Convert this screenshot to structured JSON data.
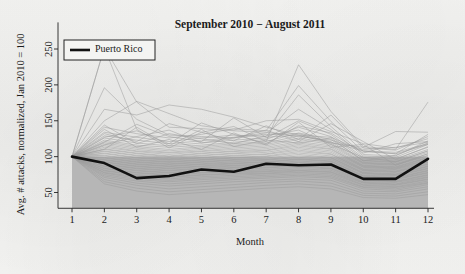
{
  "chart_data": {
    "type": "line",
    "title": "September 2010 − August 2011",
    "xlabel": "Month",
    "ylabel": "Avg. # attacks, normalized, Jan 2010 = 100",
    "xlim": [
      1,
      12
    ],
    "ylim": [
      28,
      262
    ],
    "xticks": [
      1,
      2,
      3,
      4,
      5,
      6,
      7,
      8,
      9,
      10,
      11,
      12
    ],
    "xticklabels": [
      "1",
      "2",
      "3",
      "4",
      "5",
      "6",
      "7",
      "8",
      "9",
      "10",
      "11",
      "12"
    ],
    "yticks": [
      50,
      100,
      150,
      200,
      250
    ],
    "yticklabels": [
      "50",
      "100",
      "150",
      "200",
      "250"
    ],
    "grid": false,
    "legend": {
      "position": "top-left",
      "entries": [
        {
          "name": "Puerto Rico",
          "color": "#111111",
          "linewidth": 2.6
        }
      ]
    },
    "shaded_band": {
      "description": "gray band below the normalization level",
      "from_value": 100,
      "to_value": 28,
      "color": "#b3b3b3"
    },
    "background_series_style": {
      "color": "#9a9a9a",
      "linewidth": 0.6,
      "opacity": 0.85,
      "label": "other jurisdictions"
    },
    "categories": [
      1,
      2,
      3,
      4,
      5,
      6,
      7,
      8,
      9,
      10,
      11,
      12
    ],
    "series": [
      {
        "name": "Puerto Rico",
        "highlight": true,
        "color": "#111111",
        "values": [
          100,
          91,
          70,
          73,
          82,
          79,
          90,
          88,
          89,
          69,
          69,
          97
        ]
      },
      {
        "name": "bg01",
        "values": [
          100,
          252,
          176,
          141,
          139,
          136,
          134,
          128,
          123,
          110,
          113,
          120
        ]
      },
      {
        "name": "bg02",
        "values": [
          100,
          196,
          152,
          130,
          128,
          126,
          131,
          132,
          120,
          108,
          106,
          118
        ]
      },
      {
        "name": "bg03",
        "values": [
          100,
          166,
          158,
          172,
          166,
          155,
          141,
          130,
          119,
          113,
          135,
          134
        ]
      },
      {
        "name": "bg04",
        "values": [
          100,
          150,
          177,
          160,
          143,
          137,
          150,
          152,
          135,
          118,
          112,
          125
        ]
      },
      {
        "name": "bg05",
        "values": [
          100,
          252,
          138,
          112,
          134,
          142,
          121,
          228,
          163,
          114,
          110,
          176
        ]
      },
      {
        "name": "bg06",
        "values": [
          100,
          141,
          132,
          126,
          131,
          139,
          136,
          199,
          149,
          107,
          104,
          131
        ]
      },
      {
        "name": "bg07",
        "values": [
          100,
          134,
          127,
          121,
          126,
          130,
          128,
          186,
          142,
          103,
          101,
          122
        ]
      },
      {
        "name": "bg08",
        "values": [
          100,
          129,
          123,
          118,
          122,
          127,
          133,
          166,
          138,
          101,
          99,
          117
        ]
      },
      {
        "name": "bg09",
        "values": [
          100,
          126,
          119,
          115,
          119,
          123,
          126,
          150,
          131,
          99,
          97,
          113
        ]
      },
      {
        "name": "bg10",
        "values": [
          100,
          123,
          116,
          113,
          116,
          120,
          124,
          141,
          128,
          97,
          95,
          110
        ]
      },
      {
        "name": "bg11",
        "values": [
          100,
          121,
          114,
          110,
          114,
          118,
          121,
          133,
          124,
          95,
          93,
          108
        ]
      },
      {
        "name": "bg12",
        "values": [
          100,
          119,
          112,
          108,
          112,
          116,
          119,
          129,
          121,
          94,
          92,
          106
        ]
      },
      {
        "name": "bg13",
        "values": [
          100,
          117,
          110,
          106,
          110,
          114,
          117,
          126,
          119,
          92,
          90,
          104
        ]
      },
      {
        "name": "bg14",
        "values": [
          100,
          115,
          108,
          105,
          108,
          112,
          115,
          124,
          117,
          91,
          89,
          102
        ]
      },
      {
        "name": "bg15",
        "values": [
          100,
          113,
          107,
          103,
          107,
          110,
          113,
          121,
          115,
          90,
          88,
          101
        ]
      },
      {
        "name": "bg16",
        "values": [
          100,
          111,
          105,
          101,
          105,
          108,
          111,
          119,
          113,
          88,
          86,
          99
        ]
      },
      {
        "name": "bg17",
        "values": [
          100,
          110,
          104,
          100,
          104,
          107,
          109,
          117,
          111,
          87,
          85,
          98
        ]
      },
      {
        "name": "bg18",
        "values": [
          100,
          108,
          102,
          99,
          102,
          105,
          108,
          115,
          110,
          86,
          84,
          96
        ]
      },
      {
        "name": "bg19",
        "values": [
          100,
          107,
          101,
          97,
          101,
          104,
          106,
          113,
          108,
          85,
          83,
          95
        ]
      },
      {
        "name": "bg20",
        "values": [
          100,
          105,
          99,
          96,
          99,
          102,
          104,
          111,
          106,
          83,
          82,
          93
        ]
      },
      {
        "name": "bg21",
        "values": [
          100,
          104,
          98,
          95,
          98,
          101,
          103,
          109,
          104,
          82,
          80,
          92
        ]
      },
      {
        "name": "bg22",
        "values": [
          100,
          102,
          96,
          93,
          96,
          99,
          101,
          107,
          103,
          81,
          79,
          90
        ]
      },
      {
        "name": "bg23",
        "values": [
          100,
          101,
          95,
          92,
          95,
          98,
          100,
          105,
          101,
          80,
          78,
          89
        ]
      },
      {
        "name": "bg24",
        "values": [
          100,
          99,
          93,
          90,
          93,
          96,
          98,
          103,
          99,
          78,
          76,
          87
        ]
      },
      {
        "name": "bg25",
        "values": [
          100,
          98,
          92,
          89,
          92,
          95,
          96,
          101,
          98,
          77,
          75,
          86
        ]
      },
      {
        "name": "bg26",
        "values": [
          100,
          96,
          90,
          87,
          90,
          93,
          95,
          99,
          96,
          76,
          74,
          84
        ]
      },
      {
        "name": "bg27",
        "values": [
          100,
          95,
          89,
          86,
          89,
          91,
          93,
          97,
          94,
          74,
          73,
          83
        ]
      },
      {
        "name": "bg28",
        "values": [
          100,
          93,
          87,
          84,
          87,
          90,
          92,
          96,
          93,
          73,
          71,
          81
        ]
      },
      {
        "name": "bg29",
        "values": [
          100,
          92,
          86,
          83,
          86,
          88,
          90,
          94,
          91,
          72,
          70,
          80
        ]
      },
      {
        "name": "bg30",
        "values": [
          100,
          90,
          84,
          81,
          84,
          87,
          88,
          92,
          89,
          71,
          69,
          78
        ]
      },
      {
        "name": "bg31",
        "values": [
          100,
          89,
          83,
          80,
          83,
          85,
          87,
          90,
          88,
          69,
          68,
          77
        ]
      },
      {
        "name": "bg32",
        "values": [
          100,
          87,
          81,
          78,
          81,
          84,
          85,
          88,
          86,
          68,
          66,
          75
        ]
      },
      {
        "name": "bg33",
        "values": [
          100,
          86,
          80,
          77,
          80,
          82,
          84,
          87,
          84,
          67,
          65,
          74
        ]
      },
      {
        "name": "bg34",
        "values": [
          100,
          84,
          78,
          75,
          78,
          80,
          82,
          85,
          83,
          65,
          64,
          72
        ]
      },
      {
        "name": "bg35",
        "values": [
          100,
          83,
          77,
          74,
          77,
          79,
          80,
          83,
          81,
          64,
          62,
          71
        ]
      },
      {
        "name": "bg36",
        "values": [
          100,
          81,
          75,
          72,
          75,
          77,
          79,
          81,
          79,
          63,
          61,
          69
        ]
      },
      {
        "name": "bg37",
        "values": [
          100,
          80,
          74,
          71,
          74,
          76,
          77,
          80,
          78,
          61,
          60,
          68
        ]
      },
      {
        "name": "bg38",
        "values": [
          100,
          78,
          72,
          69,
          72,
          74,
          76,
          78,
          76,
          60,
          58,
          66
        ]
      },
      {
        "name": "bg39",
        "values": [
          100,
          77,
          70,
          67,
          70,
          72,
          74,
          76,
          74,
          58,
          57,
          64
        ]
      },
      {
        "name": "bg40",
        "values": [
          100,
          75,
          68,
          65,
          68,
          70,
          72,
          74,
          72,
          57,
          55,
          63
        ]
      },
      {
        "name": "bg41",
        "values": [
          100,
          73,
          66,
          62,
          65,
          68,
          70,
          72,
          70,
          55,
          53,
          61
        ]
      },
      {
        "name": "bg42",
        "values": [
          100,
          71,
          63,
          59,
          62,
          65,
          67,
          69,
          67,
          52,
          51,
          58
        ]
      },
      {
        "name": "bg43",
        "values": [
          100,
          68,
          60,
          55,
          58,
          61,
          64,
          66,
          63,
          49,
          48,
          55
        ]
      },
      {
        "name": "bg44",
        "values": [
          100,
          65,
          56,
          51,
          54,
          57,
          60,
          62,
          59,
          46,
          45,
          51
        ]
      },
      {
        "name": "bg45",
        "values": [
          100,
          62,
          52,
          47,
          50,
          53,
          56,
          58,
          55,
          43,
          42,
          47
        ]
      },
      {
        "name": "bg46",
        "values": [
          100,
          120,
          145,
          128,
          121,
          154,
          127,
          130,
          127,
          108,
          104,
          117
        ]
      },
      {
        "name": "bg47",
        "values": [
          100,
          132,
          121,
          146,
          134,
          122,
          143,
          124,
          158,
          112,
          109,
          128
        ]
      },
      {
        "name": "bg48",
        "values": [
          100,
          127,
          136,
          118,
          147,
          131,
          118,
          143,
          133,
          105,
          118,
          121
        ]
      },
      {
        "name": "bg49",
        "values": [
          100,
          116,
          128,
          137,
          119,
          126,
          137,
          121,
          146,
          121,
          96,
          114
        ]
      },
      {
        "name": "bg50",
        "values": [
          100,
          144,
          118,
          132,
          125,
          118,
          129,
          137,
          117,
          99,
          93,
          108
        ]
      },
      {
        "name": "bg51",
        "values": [
          100,
          110,
          141,
          115,
          138,
          114,
          123,
          119,
          126,
          94,
          102,
          119
        ]
      },
      {
        "name": "bg52",
        "values": [
          100,
          138,
          113,
          124,
          110,
          133,
          116,
          148,
          113,
          117,
          88,
          104
        ]
      }
    ]
  }
}
